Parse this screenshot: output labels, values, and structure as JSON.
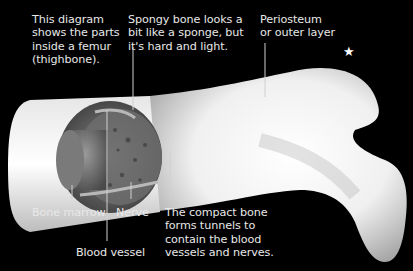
{
  "diagram": {
    "intro": "This diagram\nshows the parts\ninside a femur\n(thighbone).",
    "labels": {
      "spongy_bone": "Spongy bone looks a\nbit like a sponge, but\nit's hard and light.",
      "periosteum": "Periosteum\nor outer layer",
      "bone_marrow": "Bone marrow",
      "nerve": "Nerve",
      "blood_vessel": "Blood vessel",
      "compact_bone": "The compact bone\nforms tunnels to\ncontain the blood\nvessels and nerves."
    },
    "icons": {
      "star": "★"
    },
    "colors": {
      "background": "#000000",
      "text": "#e8e8e8",
      "bone": "#f2f2f2",
      "leader_line": "#d0d0d0"
    }
  }
}
